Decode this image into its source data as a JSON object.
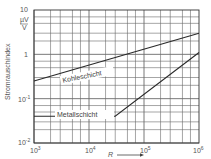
{
  "chart_data": {
    "type": "line",
    "title": "",
    "xlabel": "R",
    "ylabel": "Stromrauschindex",
    "yunit": "µV / V",
    "xscale": "log",
    "yscale": "log",
    "xlim": [
      1000,
      1000000
    ],
    "ylim": [
      0.01,
      10
    ],
    "grid": true,
    "legend": "inline labels",
    "x_ticks": [
      "10³",
      "10⁴",
      "10⁵",
      "10⁶"
    ],
    "y_ticks": [
      "10⁻²",
      "10⁻¹",
      "1",
      "10"
    ],
    "series": [
      {
        "name": "Kohleschicht",
        "x": [
          1000,
          1000000
        ],
        "y": [
          0.25,
          3.0
        ]
      },
      {
        "name": "Metallschicht",
        "x": [
          1000,
          30000,
          1000000
        ],
        "y": [
          0.04,
          0.04,
          1.1
        ]
      }
    ]
  },
  "labels": {
    "y_unit_top": "µV",
    "y_unit_bottom": "V",
    "y_axis": "Stromrauschindex",
    "x_axis": "R",
    "series_1": "Kohleschicht",
    "series_2": "Metallschicht",
    "y_tick_10": "10",
    "y_tick_1": "1",
    "y_tick_01": "10",
    "y_tick_01_exp": "-1",
    "y_tick_001": "10",
    "y_tick_001_exp": "-2",
    "x_tick_3": "10",
    "x_tick_3_exp": "3",
    "x_tick_4": "10",
    "x_tick_4_exp": "4",
    "x_tick_5": "10",
    "x_tick_5_exp": "5",
    "x_tick_6": "10",
    "x_tick_6_exp": "6"
  },
  "colors": {
    "line": "#333333",
    "grid": "#555555",
    "text": "#555555"
  }
}
